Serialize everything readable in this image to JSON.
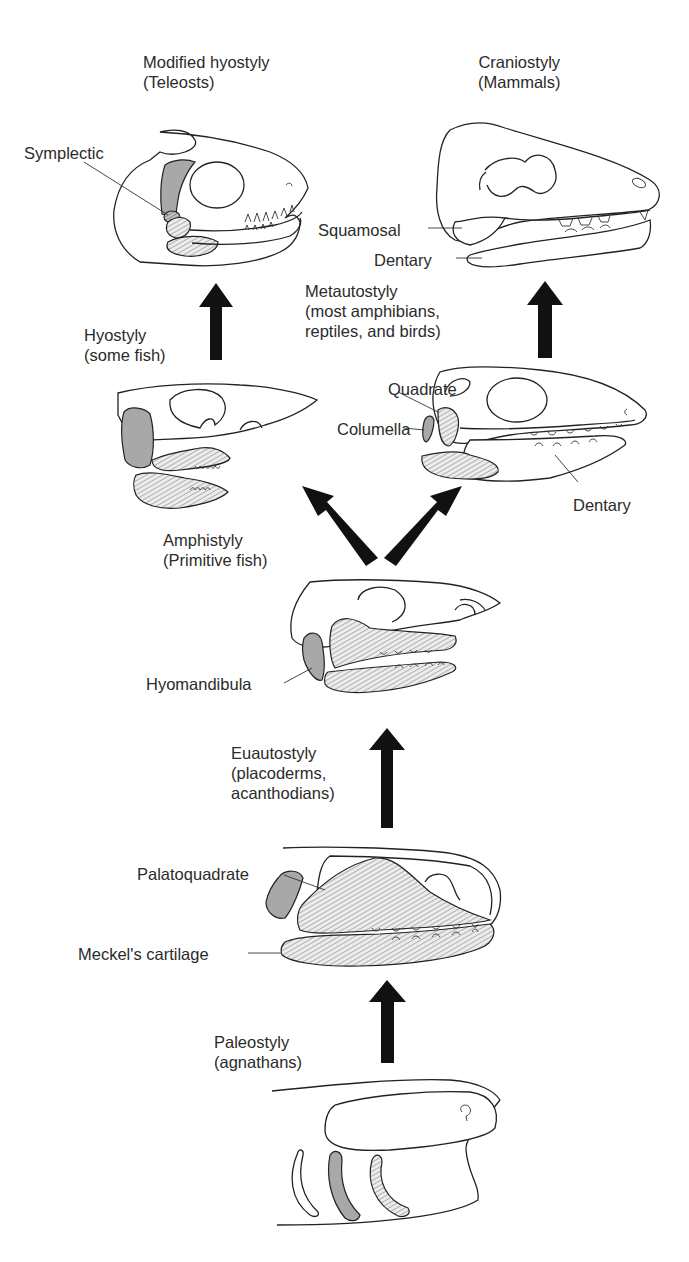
{
  "figure": {
    "stages": [
      {
        "id": "paleostyly",
        "name": "Paleostyly",
        "group": "(agnathans)"
      },
      {
        "id": "euautostyly",
        "name": "Euautostyly",
        "group_line1": "(placoderms,",
        "group_line2": "acanthodians)"
      },
      {
        "id": "amphistyly",
        "name": "Amphistyly",
        "group": "(Primitive fish)"
      },
      {
        "id": "hyostyly",
        "name": "Hyostyly",
        "group": "(some fish)"
      },
      {
        "id": "metautostyly",
        "name": "Metautostyly",
        "group_line1": "(most amphibians,",
        "group_line2": "reptiles, and birds)"
      },
      {
        "id": "modified_hyostyly",
        "name": "Modified hyostyly",
        "group": "(Teleosts)"
      },
      {
        "id": "craniostyly",
        "name": "Craniostyly",
        "group": "(Mammals)"
      }
    ],
    "part_labels": {
      "symplectic": "Symplectic",
      "squamosal": "Squamosal",
      "dentary_mammal": "Dentary",
      "quadrate": "Quadrate",
      "columella": "Columella",
      "dentary_reptile": "Dentary",
      "hyomandibula": "Hyomandibula",
      "palatoquadrate": "Palatoquadrate",
      "meckels": "Meckel's cartilage"
    },
    "arrows": [
      {
        "from": "paleostyly",
        "to": "euautostyly",
        "direction": "up"
      },
      {
        "from": "euautostyly",
        "to": "amphistyly",
        "direction": "up"
      },
      {
        "from": "amphistyly",
        "to": "hyostyly",
        "direction": "up-left"
      },
      {
        "from": "amphistyly",
        "to": "metautostyly",
        "direction": "up-right"
      },
      {
        "from": "hyostyly",
        "to": "modified_hyostyly",
        "direction": "up"
      },
      {
        "from": "metautostyly",
        "to": "craniostyly",
        "direction": "up"
      }
    ],
    "colors": {
      "background": "#ffffff",
      "line": "#222222",
      "gray_fill": "#a8a8a8",
      "arrow": "#111111"
    }
  }
}
